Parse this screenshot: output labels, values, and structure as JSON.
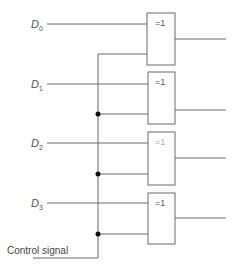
{
  "diagram": {
    "type": "logic-circuit",
    "inputs": [
      {
        "label": "D",
        "sub": "0",
        "y": 24
      },
      {
        "label": "D",
        "sub": "1",
        "y": 84
      },
      {
        "label": "D",
        "sub": "2",
        "y": 143
      },
      {
        "label": "D",
        "sub": "3",
        "y": 203
      }
    ],
    "gates": [
      {
        "symbol": "=1",
        "top": 13,
        "bottom": 65,
        "in_top": 24,
        "in_bottom": 54,
        "out": 39,
        "faint": false
      },
      {
        "symbol": "=1",
        "top": 72,
        "bottom": 124,
        "in_top": 84,
        "in_bottom": 114,
        "out": 110,
        "faint": false
      },
      {
        "symbol": "=1",
        "top": 132,
        "bottom": 185,
        "in_top": 143,
        "in_bottom": 174,
        "out": 158,
        "faint": true
      },
      {
        "symbol": "=1",
        "top": 193,
        "bottom": 244,
        "in_top": 203,
        "in_bottom": 234,
        "out": 218,
        "faint": false
      }
    ],
    "control": {
      "label": "Control signal",
      "bus_x": 98,
      "bus_top": 54,
      "bus_bottom": 258
    },
    "colors": {
      "wire": "#6a6a6a",
      "junction": "#111111",
      "text": "#555555"
    }
  }
}
